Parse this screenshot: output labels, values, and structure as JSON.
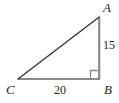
{
  "figure": {
    "type": "right-triangle",
    "background_color": "#ffffff",
    "vertices": [
      {
        "name": "A",
        "label": "A",
        "x": 99,
        "y": 17
      },
      {
        "name": "B",
        "label": "B",
        "x": 99,
        "y": 79
      },
      {
        "name": "C",
        "label": "C",
        "x": 18,
        "y": 79
      }
    ],
    "labels": {
      "vertex_a": "A",
      "vertex_b": "B",
      "vertex_c": "C"
    },
    "sides": [
      {
        "name": "leg-vertical-AB",
        "from": "A",
        "to": "B",
        "measure_label": "15",
        "color": "#8a8a8a"
      },
      {
        "name": "leg-horizontal-CB",
        "from": "C",
        "to": "B",
        "measure_label": "20",
        "color": "#8a8a8a"
      },
      {
        "name": "hypotenuse-CA",
        "from": "C",
        "to": "A",
        "measure_label": "",
        "color": "#3b3b3b"
      }
    ],
    "measures": {
      "vertical_leg": "15",
      "horizontal_leg": "20"
    },
    "right_angle": {
      "at_vertex": "B",
      "marker": "square",
      "color": "#8a8a8a",
      "size": 8
    },
    "colors": {
      "leg_stroke": "#8a8a8a",
      "hypotenuse_stroke": "#3b3b3b",
      "label_text": "#231f20",
      "background": "#ffffff"
    }
  }
}
